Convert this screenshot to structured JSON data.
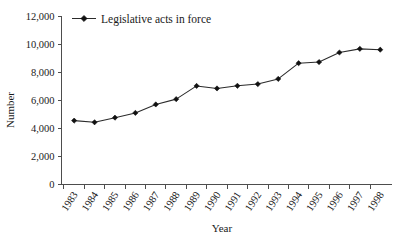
{
  "chart_data": {
    "type": "line",
    "title": "",
    "xlabel": "Year",
    "ylabel": "Number",
    "categories": [
      "1983",
      "1984",
      "1985",
      "1986",
      "1987",
      "1988",
      "1989",
      "1990",
      "1991",
      "1992",
      "1993",
      "1994",
      "1995",
      "1996",
      "1997",
      "1998"
    ],
    "series": [
      {
        "name": "Legislative acts in force",
        "values": [
          4550,
          4430,
          4760,
          5100,
          5700,
          6080,
          7020,
          6840,
          7030,
          7150,
          7520,
          8640,
          8720,
          9400,
          9660,
          9600
        ],
        "marker": "filled-diamond",
        "color": "#111111"
      }
    ],
    "ylim": [
      0,
      12000
    ],
    "ytick_labels": [
      "0",
      "2,000",
      "4,000",
      "6,000",
      "8,000",
      "10,000",
      "12,000"
    ],
    "ytick_values": [
      0,
      2000,
      4000,
      6000,
      8000,
      10000,
      12000
    ],
    "grid": false,
    "legend_position": "top-left-inside",
    "legend_entries": [
      "Legislative acts in force"
    ]
  },
  "labels": {
    "y_axis_title": "Number",
    "x_axis_title": "Year"
  }
}
